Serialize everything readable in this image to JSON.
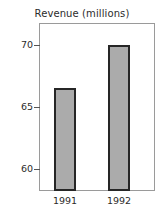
{
  "chart_data": {
    "type": "bar",
    "title": "Revenue (millions)",
    "xlabel": "",
    "ylabel": "",
    "categories": [
      "1991",
      "1992"
    ],
    "values": [
      66.5,
      70.0
    ],
    "ytick_labels": [
      "60",
      "65",
      "70"
    ],
    "yticks": [
      60,
      65,
      70
    ],
    "ylim": [
      58.4,
      71.5
    ],
    "grid": false,
    "legend": "none",
    "bar_fill_color": "#ababab",
    "bar_edge_color": "#262626",
    "frame_color": "#9a9a9a",
    "text_color": "#2b2b2b"
  },
  "figure": {
    "title": "Revenue (millions)",
    "ticks": [
      {
        "label": "70",
        "value": 70
      },
      {
        "label": "65",
        "value": 65
      },
      {
        "label": "60",
        "value": 60
      }
    ],
    "bars": [
      {
        "category": "1991",
        "value": 66.5
      },
      {
        "category": "1992",
        "value": 70.0
      }
    ]
  }
}
